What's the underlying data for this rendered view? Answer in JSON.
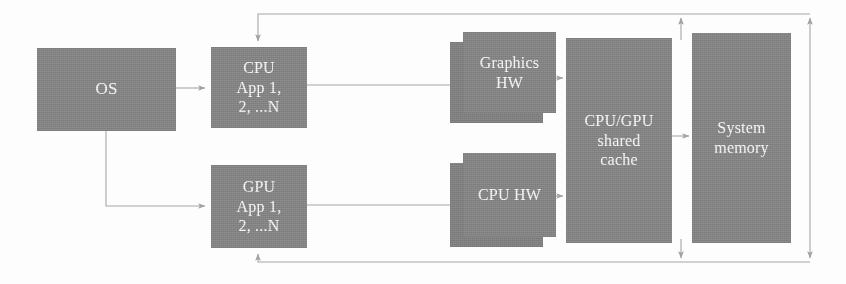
{
  "diagram": {
    "colors": {
      "box_fill": "#8e8e8e",
      "box_shadow_fill": "#8a8a8a",
      "label_text": "#ffffff",
      "connector": "#a6a6a6",
      "background": "#fdfdfd"
    },
    "nodes": [
      {
        "id": "os",
        "name": "os-block",
        "lines": [
          "OS"
        ],
        "x": 37,
        "y": 48,
        "w": 139,
        "h": 83,
        "stacked": false,
        "font_size": 17
      },
      {
        "id": "cpu_app",
        "name": "cpu-app-block",
        "lines": [
          "CPU",
          "App 1,",
          "2, ...N"
        ],
        "x": 211,
        "y": 47,
        "w": 96,
        "h": 81,
        "stacked": false,
        "font_size": 16
      },
      {
        "id": "gpu_app",
        "name": "gpu-app-block",
        "lines": [
          "GPU",
          "App 1,",
          "2, ...N"
        ],
        "x": 211,
        "y": 165,
        "w": 96,
        "h": 83,
        "stacked": false,
        "font_size": 16
      },
      {
        "id": "graphics_hw",
        "name": "graphics-hw-block",
        "lines": [
          "Graphics",
          "HW"
        ],
        "x": 463,
        "y": 32,
        "w": 93,
        "h": 81,
        "stacked": true,
        "font_size": 16
      },
      {
        "id": "cpu_hw",
        "name": "cpu-hw-block",
        "lines": [
          "CPU HW"
        ],
        "x": 463,
        "y": 153,
        "w": 93,
        "h": 84,
        "stacked": true,
        "font_size": 16
      },
      {
        "id": "shared_cache",
        "name": "cpu-gpu-shared-cache-block",
        "lines": [
          "CPU/GPU",
          "shared",
          "cache"
        ],
        "x": 566,
        "y": 38,
        "w": 106,
        "h": 205,
        "stacked": false,
        "font_size": 16
      },
      {
        "id": "system_memory",
        "name": "system-memory-block",
        "lines": [
          "System",
          "memory"
        ],
        "x": 692,
        "y": 33,
        "w": 99,
        "h": 210,
        "stacked": false,
        "font_size": 16
      }
    ],
    "connectors": [
      {
        "id": "os_to_cpu_app",
        "name": "connector-os-to-cpu-app",
        "arrow": true
      },
      {
        "id": "os_to_gpu_app",
        "name": "connector-os-to-gpu-app",
        "arrow": true
      },
      {
        "id": "cpu_app_to_graphics_hw",
        "name": "connector-cpu-app-to-graphics-hw",
        "arrow": true
      },
      {
        "id": "gpu_app_to_cpu_hw",
        "name": "connector-gpu-app-to-cpu-hw",
        "arrow": true
      },
      {
        "id": "graphics_hw_to_cache",
        "name": "connector-graphics-hw-to-shared-cache",
        "arrow": true
      },
      {
        "id": "cpu_hw_to_cache",
        "name": "connector-cpu-hw-to-shared-cache",
        "arrow": true
      },
      {
        "id": "cache_to_memory",
        "name": "connector-shared-cache-to-system-memory",
        "arrow": true
      },
      {
        "id": "cache_up_return",
        "name": "connector-shared-cache-up-to-cpu-app",
        "arrow": true
      },
      {
        "id": "memory_up_return",
        "name": "connector-system-memory-up-to-cpu-app",
        "arrow": true
      },
      {
        "id": "cache_down_return",
        "name": "connector-shared-cache-down-to-gpu-app",
        "arrow": true
      },
      {
        "id": "memory_down_return",
        "name": "connector-system-memory-down-to-gpu-app",
        "arrow": true
      }
    ]
  }
}
